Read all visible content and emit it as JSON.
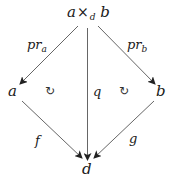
{
  "diagram": {
    "type": "commutative-diagram",
    "nodes": {
      "top": {
        "base_a": "a",
        "times": "×",
        "sub": "d",
        "base_b": "b"
      },
      "left": "a",
      "right": "b",
      "bottom": "d"
    },
    "morphisms": {
      "pr_a": {
        "base": "pr",
        "sub": "a"
      },
      "pr_b": {
        "base": "pr",
        "sub": "b"
      },
      "q": "q",
      "f": "f",
      "g": "g"
    },
    "commutativity_marks": [
      "↻",
      "↻"
    ],
    "edges": [
      {
        "from": "a ×d b",
        "to": "a",
        "label": "pr_a"
      },
      {
        "from": "a ×d b",
        "to": "b",
        "label": "pr_b"
      },
      {
        "from": "a ×d b",
        "to": "d",
        "label": "q"
      },
      {
        "from": "a",
        "to": "d",
        "label": "f"
      },
      {
        "from": "b",
        "to": "d",
        "label": "g"
      }
    ],
    "colors": {
      "stroke": "#333333",
      "text": "#1a1a1a"
    }
  }
}
